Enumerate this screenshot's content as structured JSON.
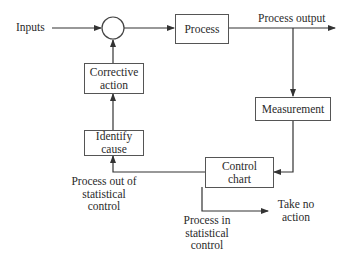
{
  "diagram": {
    "type": "flowchart",
    "nodes": {
      "inputs": "Inputs",
      "summing_junction": "",
      "process": "Process",
      "process_output": "Process output",
      "measurement": "Measurement",
      "control_chart": "Control chart",
      "identify_cause": "Identify cause",
      "corrective_action": "Corrective action",
      "out_of_control": "Process out of statistical control",
      "in_control": "Process in statistical control",
      "take_no_action": "Take no action"
    },
    "labels": {
      "inputs": "Inputs",
      "process": "Process",
      "process_output": "Process output",
      "measurement": "Measurement",
      "control_chart_l1": "Control",
      "control_chart_l2": "chart",
      "identify_cause_l1": "Identify",
      "identify_cause_l2": "cause",
      "corrective_action_l1": "Corrective",
      "corrective_action_l2": "action",
      "out_of_control_l1": "Process out of",
      "out_of_control_l2": "statistical",
      "out_of_control_l3": "control",
      "in_control_l1": "Process in",
      "in_control_l2": "statistical",
      "in_control_l3": "control",
      "take_no_action_l1": "Take no",
      "take_no_action_l2": "action"
    },
    "edges": [
      {
        "from": "inputs",
        "to": "summing_junction"
      },
      {
        "from": "summing_junction",
        "to": "process"
      },
      {
        "from": "process",
        "to": "process_output"
      },
      {
        "from": "process_output",
        "to": "measurement"
      },
      {
        "from": "measurement",
        "to": "control_chart"
      },
      {
        "from": "control_chart",
        "to": "identify_cause",
        "label": "Process out of statistical control"
      },
      {
        "from": "identify_cause",
        "to": "corrective_action"
      },
      {
        "from": "corrective_action",
        "to": "summing_junction"
      },
      {
        "from": "control_chart",
        "to": "take_no_action",
        "label": "Process in statistical control"
      }
    ]
  }
}
